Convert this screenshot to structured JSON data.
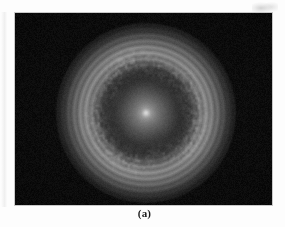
{
  "figure": {
    "caption": "(a)",
    "page_background": "#fdfdfd",
    "panel": {
      "background": "#050505",
      "border_color": "#c9c9c9",
      "left": 14,
      "top": 12,
      "width": 259,
      "height": 194
    }
  },
  "chart_data": {
    "type": "heatmap",
    "title": "",
    "subtitle": "",
    "xlabel": "",
    "ylabel": "",
    "annotations": [
      "(a)"
    ],
    "legend": [],
    "grid": false,
    "colormap": "grayscale",
    "value_range": [
      0,
      255
    ],
    "center_px": [
      146,
      112
    ],
    "radial_profile": {
      "radius_px": [
        0,
        2,
        5,
        10,
        16,
        22,
        28,
        32,
        36,
        42,
        48,
        54,
        60,
        66,
        72,
        80
      ],
      "intensity": [
        242,
        205,
        160,
        132,
        112,
        92,
        66,
        52,
        96,
        138,
        150,
        132,
        96,
        52,
        20,
        4
      ],
      "features": [
        {
          "name": "central-core",
          "radius_px": 3,
          "peak_intensity": 242
        },
        {
          "name": "inner-glow",
          "radius_px": [
            3,
            26
          ],
          "intensity_range": [
            200,
            70
          ]
        },
        {
          "name": "dark-gap-ring",
          "radius_px": [
            28,
            35
          ],
          "intensity_range": [
            66,
            50
          ]
        },
        {
          "name": "speckled-halo-ring",
          "radius_px": [
            36,
            58
          ],
          "intensity_range": [
            96,
            155
          ]
        },
        {
          "name": "outer-falloff",
          "radius_px": [
            58,
            80
          ],
          "intensity_range": [
            130,
            4
          ]
        }
      ]
    },
    "extent_px": {
      "x": [
        85,
        210
      ],
      "y": [
        48,
        175
      ]
    },
    "texture": "granular speckle with ~3 px grain in the halo ring"
  },
  "artifacts": {
    "top_right_smudge": "light-gray scan smudge",
    "left_margin_streak": "faint gray vertical streak"
  }
}
